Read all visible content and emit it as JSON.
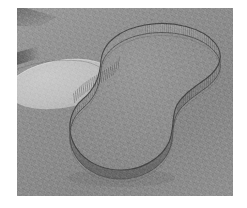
{
  "figure": {
    "domain_label": "3D shaded mesh rendering",
    "caption": "",
    "colors": {
      "background_plate": "#8a8a8a",
      "backdrop_light": "#9a9a9a",
      "backdrop_dark": "#868686",
      "surface_fill": "#8c8c8c",
      "plateau_fill": "#c1c1c1",
      "rim_outline": "#3a3a3a",
      "wall_shade": "#6f6f6f",
      "wall_highlight": "#a5a5a5",
      "mat_border": "#ffffff"
    },
    "frame": {
      "left": 17,
      "top": 8,
      "width": 216,
      "height": 188
    },
    "elements": [
      {
        "name": "peanut-shell",
        "label": "Peanut-shaped extruded shell"
      },
      {
        "name": "shell-wall",
        "label": "Striped vertical wall"
      },
      {
        "name": "rim-top-curve",
        "label": "Upper rim curve"
      },
      {
        "name": "base-outline",
        "label": "Base footprint outline"
      },
      {
        "name": "plateau-disc",
        "label": "Light elliptical disc"
      },
      {
        "name": "ground-plane",
        "label": "Shaded ground plane"
      }
    ],
    "annotations": [],
    "axis_labels": [],
    "legend": []
  }
}
